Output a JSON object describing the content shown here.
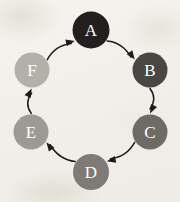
{
  "figure": {
    "background_color": "#f1efe9",
    "edge_color": "#1d1c1a",
    "label_color": "#ffffff",
    "width": 180,
    "height": 202,
    "layout": "circular",
    "direction": "clockwise"
  },
  "nodes": [
    {
      "id": "A",
      "label": "A",
      "cx": 91,
      "cy": 30,
      "r": 18.5,
      "color": "#231f1e",
      "label_color": "#ffffff"
    },
    {
      "id": "B",
      "label": "B",
      "cx": 150,
      "cy": 70,
      "r": 17.5,
      "color": "#4a4644",
      "label_color": "#ffffff"
    },
    {
      "id": "C",
      "label": "C",
      "cx": 150,
      "cy": 132,
      "r": 17.5,
      "color": "#6e6a66",
      "label_color": "#ffffff"
    },
    {
      "id": "D",
      "label": "D",
      "cx": 91,
      "cy": 172,
      "r": 18.0,
      "color": "#7e7b77",
      "label_color": "#ffffff"
    },
    {
      "id": "E",
      "label": "E",
      "cx": 31,
      "cy": 132,
      "r": 17.5,
      "color": "#9d9a94",
      "label_color": "#ffffff"
    },
    {
      "id": "F",
      "label": "F",
      "cx": 32,
      "cy": 70,
      "r": 17.5,
      "color": "#b3b0a9",
      "label_color": "#ffffff"
    }
  ],
  "edges": [
    {
      "from": "A",
      "to": "B",
      "directed": true,
      "arrow_at": "B"
    },
    {
      "from": "B",
      "to": "C",
      "directed": true,
      "arrow_at": "C"
    },
    {
      "from": "C",
      "to": "D",
      "directed": true,
      "arrow_at": "D"
    },
    {
      "from": "D",
      "to": "E",
      "directed": true,
      "arrow_at": "E"
    },
    {
      "from": "E",
      "to": "F",
      "directed": true,
      "arrow_at": "F"
    },
    {
      "from": "F",
      "to": "A",
      "directed": true,
      "arrow_at": "A"
    }
  ],
  "chart_data": {
    "type": "diagram",
    "node_ids": [
      "A",
      "B",
      "C",
      "D",
      "E",
      "F"
    ],
    "edge_list": [
      [
        "A",
        "B"
      ],
      [
        "B",
        "C"
      ],
      [
        "C",
        "D"
      ],
      [
        "D",
        "E"
      ],
      [
        "E",
        "F"
      ],
      [
        "F",
        "A"
      ]
    ],
    "node_count": 6,
    "edge_count": 6,
    "cycle": true,
    "orientation": "clockwise"
  }
}
